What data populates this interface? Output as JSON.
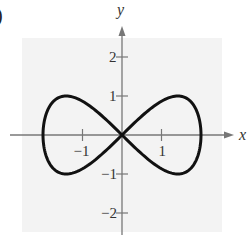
{
  "panel_label": ")",
  "chart_data": {
    "type": "line",
    "title": "",
    "xlabel": "x",
    "ylabel": "y",
    "xlim": [
      -2.5,
      2.5
    ],
    "ylim": [
      -2.5,
      2.5
    ],
    "grid": false,
    "background": "#f3f3f3",
    "curve": {
      "description": "figure-eight (lemniscate of Gerono): x = 2cos t, y = sin 2t",
      "param_x": "2*cos(t)",
      "param_y": "sin(2*t)",
      "t_range": [
        0,
        6.2832
      ],
      "color": "#111111",
      "key_points": [
        {
          "x": -2,
          "y": 0
        },
        {
          "x": -1.414,
          "y": 1
        },
        {
          "x": 0,
          "y": 0
        },
        {
          "x": 1.414,
          "y": 1
        },
        {
          "x": 2,
          "y": 0
        },
        {
          "x": 1.414,
          "y": -1
        },
        {
          "x": -1.414,
          "y": -1
        }
      ]
    },
    "x_ticks": [
      {
        "value": -1,
        "label": "−1"
      },
      {
        "value": 1,
        "label": "1"
      }
    ],
    "y_ticks": [
      {
        "value": 2,
        "label": "2"
      },
      {
        "value": 1,
        "label": "1"
      },
      {
        "value": -1,
        "label": "−1"
      },
      {
        "value": -2,
        "label": "−2"
      }
    ],
    "axis_color": "#777777"
  }
}
